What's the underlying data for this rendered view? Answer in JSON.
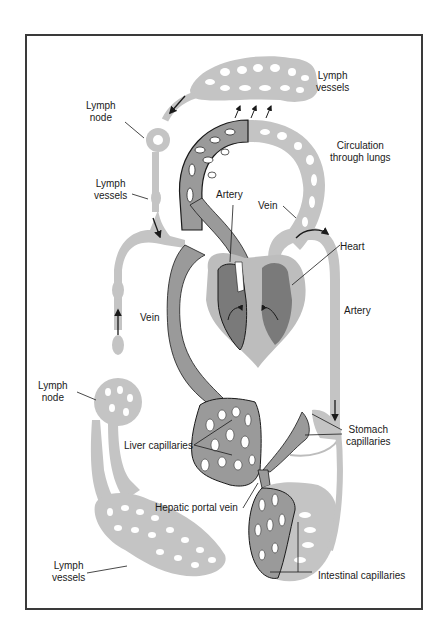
{
  "figure": {
    "type": "circulatory-lymphatic-system-diagram",
    "colors": {
      "lymph_gray": "#c4c4c4",
      "vessel_dark_gray": "#9a9a9a",
      "heart_chamber": "#7a7a7a",
      "heart_wall": "#bdbdbd",
      "outline": "#1a1a1a",
      "background": "#ffffff"
    },
    "labels": {
      "lymph_vessels_top": "Lymph\nvessels",
      "lymph_node_top": "Lymph\nnode",
      "circulation_lungs": "Circulation\nthrough lungs",
      "lymph_vessels_mid": "Lymph\nvessels",
      "artery_top": "Artery",
      "vein_top": "Vein",
      "heart": "Heart",
      "vein_left": "Vein",
      "artery_right": "Artery",
      "lymph_node_bottom": "Lymph\nnode",
      "liver_capillaries": "Liver capillaries",
      "stomach_capillaries": "Stomach\ncapillaries",
      "hepatic_portal_vein": "Hepatic portal vein",
      "lymph_vessels_bottom": "Lymph\nvessels",
      "intestinal_capillaries": "Intestinal capillaries"
    }
  }
}
